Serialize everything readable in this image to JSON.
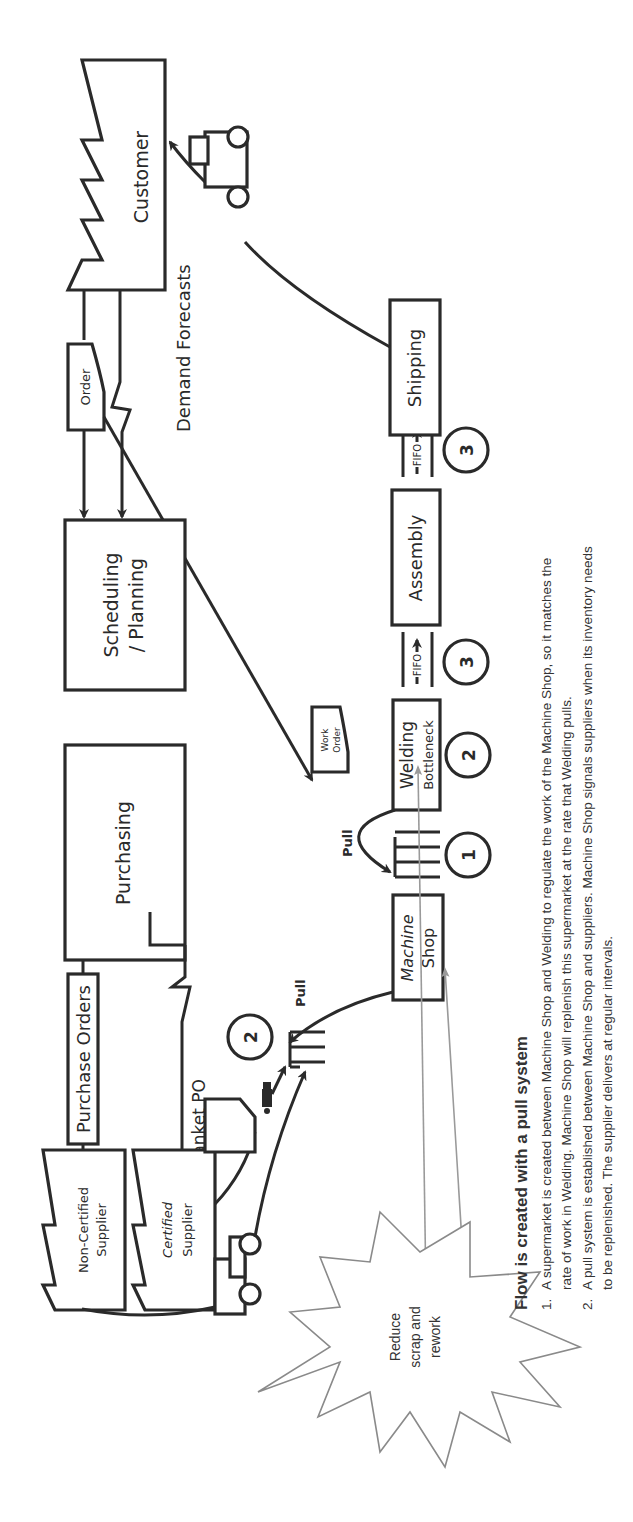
{
  "diagram": {
    "orientation": "rotated-90-ccw",
    "nodes": {
      "customer": "Customer",
      "order": "Order",
      "demand_forecasts": "Demand Forecasts",
      "scheduling": [
        "Scheduling",
        "/ Planning"
      ],
      "purchasing": "Purchasing",
      "purchase_orders": "Purchase Orders",
      "blanket_po": "Blanket PO",
      "non_certified_supplier": [
        "Non-Certified",
        "Supplier"
      ],
      "certified_supplier": [
        "Certified",
        "Supplier"
      ],
      "work_order": [
        "Work",
        "Order"
      ],
      "shipping": "Shipping",
      "assembly": "Assembly",
      "welding": [
        "Welding",
        "Bottleneck"
      ],
      "machine_shop": [
        "Machine",
        "Shop"
      ],
      "pull_label_1": "Pull",
      "pull_label_2": "Pull",
      "fifo_1": "FIFO",
      "fifo_2": "FIFO",
      "kaizen_burst": [
        "Reduce",
        "scrap and",
        "rework"
      ]
    },
    "markers": {
      "supermarket_welding": "1",
      "welding": "2",
      "supplier_pull": "2",
      "fifo_assembly": "3",
      "fifo_shipping": "3"
    }
  },
  "notes": {
    "title": "Flow is created with a pull system",
    "items": [
      {
        "num": "1.",
        "lines": [
          "A supermarket is created between Machine Shop and Welding to regulate the work of the Machine Shop, so it matches the",
          "rate of work in Welding.  Machine Shop will replenish this supermarket at the rate that Welding pulls."
        ]
      },
      {
        "num": "2.",
        "lines": [
          "A pull system is established between Machine Shop and suppliers.  Machine Shop signals suppliers when its inventory needs",
          "to be replenished.  The supplier delivers at regular intervals."
        ]
      }
    ]
  },
  "colors": {
    "ink": "#2a2a2a",
    "grey_arrow": "#9a9a9a",
    "background": "#ffffff"
  }
}
